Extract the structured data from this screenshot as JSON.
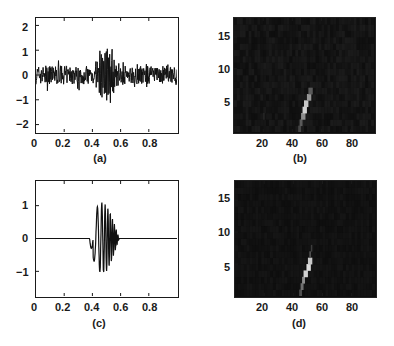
{
  "chart_data": [
    {
      "id": "a",
      "type": "line",
      "caption": "(a)",
      "title": "",
      "xlabel": "",
      "ylabel": "",
      "xlim": [
        0,
        1
      ],
      "ylim": [
        -2.3,
        2.3
      ],
      "xticks": [
        "0",
        "0.2",
        "0.4",
        "0.6",
        "0.8"
      ],
      "yticks": [
        "2",
        "1",
        "0",
        "-1",
        "-2"
      ],
      "grid": false,
      "description": "Noisy signal: background noise amplitude ~±0.5 across 0..1, with a burst centered near x≈0.5 reaching peaks of about +1.2 and -1.5",
      "series": [
        {
          "name": "noisy signal",
          "peak_max": 1.2,
          "peak_min": -1.5,
          "burst_center": 0.5,
          "noise_amplitude": 0.5
        }
      ]
    },
    {
      "id": "b",
      "type": "heatmap",
      "caption": "(b)",
      "xlim": [
        0,
        96
      ],
      "ylim": [
        0,
        18
      ],
      "xticks": [
        "20",
        "40",
        "60",
        "80"
      ],
      "yticks": [
        "15",
        "10",
        "5"
      ],
      "grid": false,
      "description": "Dark time-frequency map with a bright slanted ridge from about (45,0) to (53,6), brightest near (49-51,3-5)"
    },
    {
      "id": "c",
      "type": "line",
      "caption": "(c)",
      "xlim": [
        0,
        1
      ],
      "ylim": [
        -1.75,
        1.75
      ],
      "xticks": [
        "0",
        "0.2",
        "0.4",
        "0.6",
        "0.8"
      ],
      "yticks": [
        "1",
        "0",
        "-1"
      ],
      "grid": false,
      "description": "Clean chirp-like wavelet: flat zero except between x≈0.38 and 0.58, first dip ≈-0.3 at 0.41, peaks ≈+1.15 near 0.5 and ≈-1.0 near 0.49",
      "series": [
        {
          "name": "clean signal",
          "peak_max": 1.15,
          "peak_min": -1.0,
          "start": 0.38,
          "end": 0.58
        }
      ]
    },
    {
      "id": "d",
      "type": "heatmap",
      "caption": "(d)",
      "xlim": [
        0,
        96
      ],
      "ylim": [
        0,
        18
      ],
      "xticks": [
        "20",
        "40",
        "60",
        "80"
      ],
      "yticks": [
        "15",
        "10",
        "5"
      ],
      "grid": false,
      "description": "Same as (b) but cleaner: bright ridge from about (44,0) to (52,6), brightest cells near (50-51,4-5)"
    }
  ]
}
